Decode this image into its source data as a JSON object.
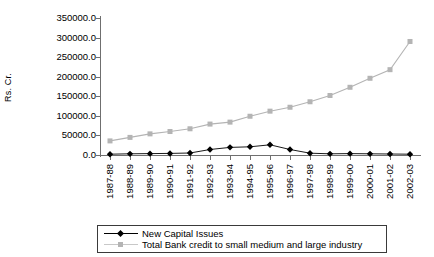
{
  "chart_data": {
    "type": "line",
    "title": "",
    "xlabel": "",
    "ylabel": "Rs. Cr.",
    "ylim": [
      0,
      350000
    ],
    "ytick_step": 50000,
    "grid": false,
    "legend_position": "bottom",
    "categories": [
      "1987-88",
      "1988-89",
      "1989-90",
      "1990-91",
      "1991-92",
      "1992-93",
      "1993-94",
      "1994-95",
      "1995-96",
      "1996-97",
      "1997-98",
      "1998-99",
      "1999-00",
      "2000-01",
      "2001-02",
      "2002-03"
    ],
    "ytick_labels": [
      "0.0",
      "50000.0",
      "100000.0",
      "150000.0",
      "200000.0",
      "250000.0",
      "300000.0",
      "350000.0"
    ],
    "ytick_values": [
      0,
      50000,
      100000,
      150000,
      200000,
      250000,
      300000,
      350000
    ],
    "series": [
      {
        "name": "New Capital Issues",
        "color": "#000000",
        "marker": "diamond",
        "values": [
          2000,
          3000,
          3500,
          4000,
          5000,
          14000,
          19500,
          21000,
          26000,
          14000,
          4500,
          3000,
          3500,
          3000,
          2500,
          2000
        ]
      },
      {
        "name": "Total Bank credit to small medium and large industry",
        "color": "#b4b4b4",
        "marker": "square",
        "values": [
          36000,
          45000,
          54000,
          60000,
          67000,
          79000,
          84000,
          99000,
          112000,
          122000,
          136000,
          152000,
          173000,
          196000,
          218000,
          290000
        ]
      }
    ]
  },
  "legend": {
    "entries": [
      "New Capital Issues",
      "Total Bank credit to small medium and large industry"
    ]
  }
}
